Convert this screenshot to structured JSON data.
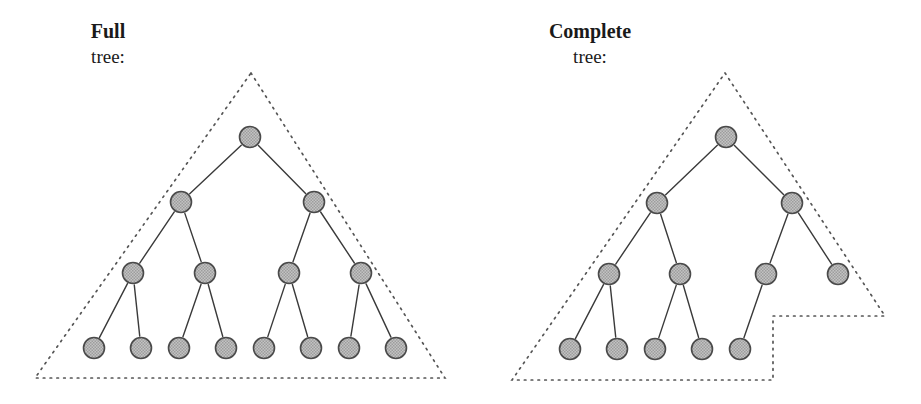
{
  "figure": {
    "background_color": "#ffffff",
    "node_fill_color": "#b8b8b8",
    "node_stroke_color": "#4a4a4a",
    "edge_color": "#3a3a3a",
    "boundary_color": "#555555",
    "node_radius": 10.5
  },
  "panels": [
    {
      "id": "full-tree",
      "title": "Full",
      "subtitle": "tree:",
      "title_x": 108,
      "title_y": 38,
      "subtitle_x": 108,
      "subtitle_y": 63,
      "boundary_type": "triangle",
      "boundary_points": "251,73 445,378 35,378 251,73",
      "nodes": [
        {
          "id": "n0",
          "level": 0,
          "x": 250,
          "y": 137
        },
        {
          "id": "n1",
          "level": 1,
          "x": 181,
          "y": 202
        },
        {
          "id": "n2",
          "level": 1,
          "x": 314,
          "y": 202
        },
        {
          "id": "n3",
          "level": 2,
          "x": 133,
          "y": 273
        },
        {
          "id": "n4",
          "level": 2,
          "x": 205,
          "y": 273
        },
        {
          "id": "n5",
          "level": 2,
          "x": 289,
          "y": 273
        },
        {
          "id": "n6",
          "level": 2,
          "x": 361,
          "y": 273
        },
        {
          "id": "n7",
          "level": 3,
          "x": 94,
          "y": 348
        },
        {
          "id": "n8",
          "level": 3,
          "x": 141,
          "y": 348
        },
        {
          "id": "n9",
          "level": 3,
          "x": 179,
          "y": 348
        },
        {
          "id": "n10",
          "level": 3,
          "x": 226,
          "y": 348
        },
        {
          "id": "n11",
          "level": 3,
          "x": 264,
          "y": 348
        },
        {
          "id": "n12",
          "level": 3,
          "x": 311,
          "y": 348
        },
        {
          "id": "n13",
          "level": 3,
          "x": 349,
          "y": 348
        },
        {
          "id": "n14",
          "level": 3,
          "x": 396,
          "y": 348
        }
      ],
      "edges": [
        {
          "from": "n0",
          "to": "n1"
        },
        {
          "from": "n0",
          "to": "n2"
        },
        {
          "from": "n1",
          "to": "n3"
        },
        {
          "from": "n1",
          "to": "n4"
        },
        {
          "from": "n2",
          "to": "n5"
        },
        {
          "from": "n2",
          "to": "n6"
        },
        {
          "from": "n3",
          "to": "n7"
        },
        {
          "from": "n3",
          "to": "n8"
        },
        {
          "from": "n4",
          "to": "n9"
        },
        {
          "from": "n4",
          "to": "n10"
        },
        {
          "from": "n5",
          "to": "n11"
        },
        {
          "from": "n5",
          "to": "n12"
        },
        {
          "from": "n6",
          "to": "n13"
        },
        {
          "from": "n6",
          "to": "n14"
        }
      ]
    },
    {
      "id": "complete-tree",
      "title": "Complete",
      "subtitle": "tree:",
      "title_x": 590,
      "title_y": 38,
      "subtitle_x": 590,
      "subtitle_y": 63,
      "boundary_type": "stepped",
      "boundary_points": "725,73 885,316 773,316 773,380 512,380 725,73",
      "nodes": [
        {
          "id": "m0",
          "level": 0,
          "x": 726,
          "y": 137
        },
        {
          "id": "m1",
          "level": 1,
          "x": 657,
          "y": 203
        },
        {
          "id": "m2",
          "level": 1,
          "x": 792,
          "y": 203
        },
        {
          "id": "m3",
          "level": 2,
          "x": 609,
          "y": 274
        },
        {
          "id": "m4",
          "level": 2,
          "x": 680,
          "y": 274
        },
        {
          "id": "m5",
          "level": 2,
          "x": 766,
          "y": 274
        },
        {
          "id": "m6",
          "level": 2,
          "x": 838,
          "y": 274
        },
        {
          "id": "m7",
          "level": 3,
          "x": 570,
          "y": 349
        },
        {
          "id": "m8",
          "level": 3,
          "x": 617,
          "y": 349
        },
        {
          "id": "m9",
          "level": 3,
          "x": 655,
          "y": 349
        },
        {
          "id": "m10",
          "level": 3,
          "x": 702,
          "y": 349
        },
        {
          "id": "m11",
          "level": 3,
          "x": 740,
          "y": 349
        }
      ],
      "edges": [
        {
          "from": "m0",
          "to": "m1"
        },
        {
          "from": "m0",
          "to": "m2"
        },
        {
          "from": "m1",
          "to": "m3"
        },
        {
          "from": "m1",
          "to": "m4"
        },
        {
          "from": "m2",
          "to": "m5"
        },
        {
          "from": "m2",
          "to": "m6"
        },
        {
          "from": "m3",
          "to": "m7"
        },
        {
          "from": "m3",
          "to": "m8"
        },
        {
          "from": "m4",
          "to": "m9"
        },
        {
          "from": "m4",
          "to": "m10"
        },
        {
          "from": "m5",
          "to": "m11"
        }
      ]
    }
  ]
}
